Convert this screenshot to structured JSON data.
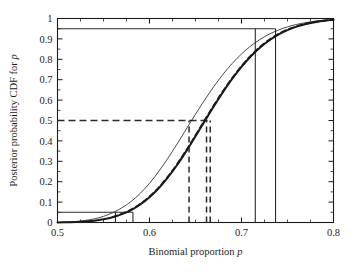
{
  "figure": {
    "background": "#ffffff",
    "frame_color": "#1a1a1a",
    "width": 355,
    "height": 275
  },
  "chart_data": {
    "type": "line",
    "title": "",
    "xlabel": "Binomial proportion p",
    "ylabel": "Posterior probability CDF for p",
    "xlim": [
      0.5,
      0.8
    ],
    "ylim": [
      0,
      1
    ],
    "grid": false,
    "legend": "none",
    "xticks": [
      0.5,
      0.6,
      0.7,
      0.8
    ],
    "xticklabels": [
      "0.5",
      "0.6",
      "0.7",
      "0.8"
    ],
    "xminorticks": [
      0.525,
      0.55,
      0.575,
      0.625,
      0.65,
      0.675,
      0.725,
      0.75,
      0.775
    ],
    "yticks": [
      0,
      0.1,
      0.2,
      0.3,
      0.4,
      0.5,
      0.6,
      0.7,
      0.8,
      0.9,
      1
    ],
    "yticklabels": [
      "0",
      "0.1",
      "0.2",
      "0.3",
      "0.4",
      "0.5",
      "0.6",
      "0.7",
      "0.8",
      "0.9",
      "1"
    ],
    "yminorticks": [
      0.05,
      0.15,
      0.25,
      0.35,
      0.45,
      0.55,
      0.65,
      0.75,
      0.85,
      0.95
    ],
    "series": [
      {
        "name": "cdf-thin",
        "style": "solid-thin",
        "linewidth": 0.8,
        "color": "#1a1a1a",
        "x": [
          0.5,
          0.51,
          0.52,
          0.53,
          0.54,
          0.55,
          0.56,
          0.57,
          0.58,
          0.59,
          0.6,
          0.61,
          0.62,
          0.63,
          0.64,
          0.65,
          0.66,
          0.67,
          0.68,
          0.69,
          0.7,
          0.71,
          0.72,
          0.73,
          0.74,
          0.75,
          0.76,
          0.77,
          0.78,
          0.79,
          0.8
        ],
        "y": [
          0.0,
          0.002,
          0.005,
          0.01,
          0.018,
          0.03,
          0.048,
          0.072,
          0.103,
          0.143,
          0.192,
          0.25,
          0.315,
          0.385,
          0.458,
          0.531,
          0.601,
          0.667,
          0.727,
          0.78,
          0.826,
          0.865,
          0.897,
          0.923,
          0.943,
          0.959,
          0.971,
          0.98,
          0.987,
          0.992,
          0.995
        ]
      },
      {
        "name": "cdf-thick",
        "style": "solid-thick",
        "linewidth": 2.0,
        "color": "#1a1a1a",
        "x": [
          0.5,
          0.51,
          0.52,
          0.53,
          0.54,
          0.55,
          0.56,
          0.57,
          0.58,
          0.59,
          0.6,
          0.61,
          0.62,
          0.63,
          0.64,
          0.65,
          0.66,
          0.67,
          0.68,
          0.69,
          0.7,
          0.71,
          0.72,
          0.73,
          0.74,
          0.75,
          0.76,
          0.77,
          0.78,
          0.79,
          0.8
        ],
        "y": [
          0.0,
          0.001,
          0.002,
          0.005,
          0.009,
          0.016,
          0.026,
          0.041,
          0.061,
          0.089,
          0.124,
          0.168,
          0.221,
          0.282,
          0.35,
          0.423,
          0.497,
          0.57,
          0.64,
          0.705,
          0.763,
          0.814,
          0.857,
          0.892,
          0.921,
          0.943,
          0.96,
          0.973,
          0.982,
          0.989,
          0.993
        ]
      },
      {
        "name": "cdf-dashed-overlay",
        "style": "dashed-thick",
        "linewidth": 1.8,
        "color": "#1a1a1a",
        "x": [
          0.56,
          0.58,
          0.6,
          0.62,
          0.64,
          0.66,
          0.68,
          0.7,
          0.72,
          0.74,
          0.76,
          0.78,
          0.8
        ],
        "y": [
          0.027,
          0.063,
          0.127,
          0.225,
          0.355,
          0.502,
          0.645,
          0.767,
          0.861,
          0.924,
          0.962,
          0.983,
          0.994
        ]
      }
    ],
    "reference_lines": {
      "horizontal": [
        {
          "name": "upper-credible-level",
          "value": 0.95,
          "style": "solid",
          "x_from": 0.5,
          "x_to": 0.737
        },
        {
          "name": "lower-credible-level",
          "value": 0.05,
          "style": "solid",
          "x_from": 0.5,
          "x_to": 0.582
        },
        {
          "name": "median-level",
          "value": 0.5,
          "style": "dashed",
          "x_from": 0.5,
          "x_to": 0.666
        }
      ],
      "vertical": [
        {
          "name": "lower-bound-thin",
          "value": 0.563,
          "style": "solid",
          "y_from": 0.0,
          "y_to": 0.05
        },
        {
          "name": "lower-bound-thick",
          "value": 0.582,
          "style": "solid",
          "y_from": 0.0,
          "y_to": 0.05
        },
        {
          "name": "median-thin",
          "value": 0.643,
          "style": "dashed",
          "y_from": 0.0,
          "y_to": 0.5
        },
        {
          "name": "median-thick-a",
          "value": 0.662,
          "style": "dashed",
          "y_from": 0.0,
          "y_to": 0.5
        },
        {
          "name": "median-thick-b",
          "value": 0.666,
          "style": "dashed",
          "y_from": 0.0,
          "y_to": 0.5
        },
        {
          "name": "upper-bound-thin",
          "value": 0.715,
          "style": "solid",
          "y_from": 0.0,
          "y_to": 0.95
        },
        {
          "name": "upper-bound-thick",
          "value": 0.737,
          "style": "solid",
          "y_from": 0.0,
          "y_to": 0.95
        }
      ]
    }
  }
}
